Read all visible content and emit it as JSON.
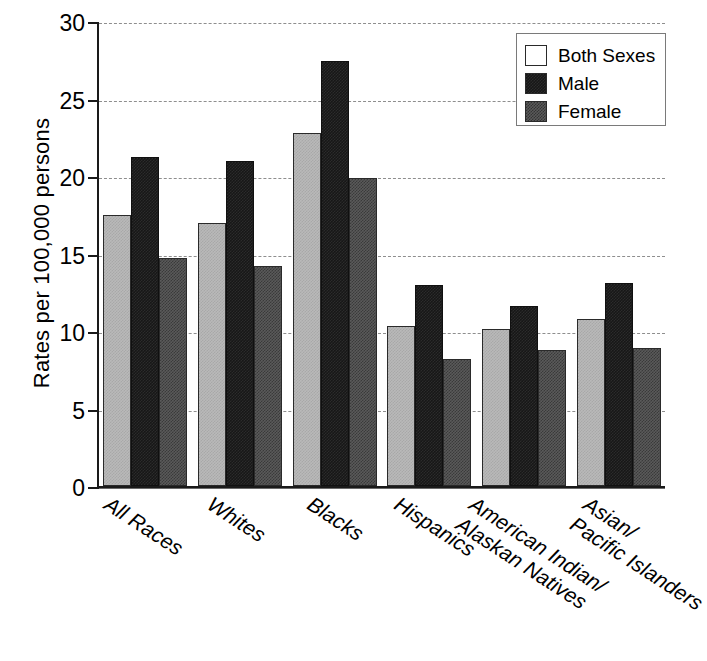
{
  "chart_data": {
    "type": "bar",
    "title": "",
    "xlabel": "",
    "ylabel": "Rates per 100,000 persons",
    "ylim": [
      0,
      30
    ],
    "ytick_labels": [
      "0",
      "5",
      "10",
      "15",
      "20",
      "25",
      "30"
    ],
    "ytick_values": [
      0,
      5,
      10,
      15,
      20,
      25,
      30
    ],
    "grid": true,
    "grid_axis": "y",
    "legend_position": "top-right",
    "categories": [
      "All Races",
      "Whites",
      "Blacks",
      "Hispanics",
      "American Indian/ Alaskan Natives",
      "Asian/ Pacific Islanders"
    ],
    "category_lines": [
      [
        "All Races"
      ],
      [
        "Whites"
      ],
      [
        "Blacks"
      ],
      [
        "Hispanics"
      ],
      [
        "American Indian/",
        "Alaskan Natives"
      ],
      [
        "Asian/",
        "Pacific Islanders"
      ]
    ],
    "series": [
      {
        "name": "Both Sexes",
        "color": "#b9b9b9",
        "values": [
          17.5,
          17.0,
          22.8,
          10.3,
          10.1,
          10.8
        ]
      },
      {
        "name": "Male",
        "color": "#171717",
        "values": [
          21.2,
          21.0,
          27.4,
          13.0,
          11.6,
          13.1
        ]
      },
      {
        "name": "Female",
        "color": "#5a5a5a",
        "values": [
          14.7,
          14.2,
          19.9,
          8.2,
          8.8,
          8.9
        ]
      }
    ]
  },
  "legend": {
    "entries": [
      {
        "label": "Both Sexes",
        "swatch": "both"
      },
      {
        "label": "Male",
        "swatch": "male"
      },
      {
        "label": "Female",
        "swatch": "female"
      }
    ]
  }
}
